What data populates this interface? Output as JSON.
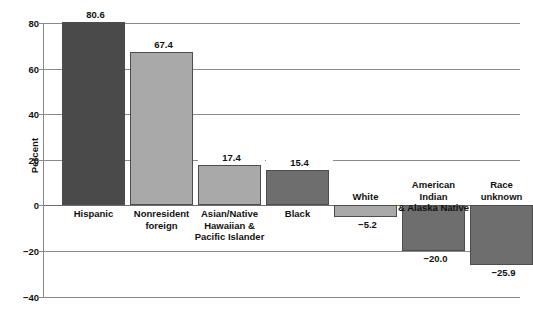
{
  "chart_data": {
    "type": "bar",
    "title": "",
    "xlabel": "",
    "ylabel": "Percent",
    "ylim": [
      -40,
      80
    ],
    "ytick_step": 20,
    "yticks": [
      "80",
      "60",
      "40",
      "20",
      "0",
      "-20",
      "-40"
    ],
    "grid": true,
    "legend": "none",
    "categories": [
      "Hispanic",
      "Nonresident foreign",
      "Asian/Native Hawaiian & Pacific Islander",
      "Black",
      "White",
      "American Indian & Alaska Native",
      "Race unknown"
    ],
    "category_lines": [
      [
        "Hispanic"
      ],
      [
        "Nonresident",
        "foreign"
      ],
      [
        "Asian/Native",
        "Hawaiian &",
        "Pacific Islander"
      ],
      [
        "Black"
      ],
      [
        "White"
      ],
      [
        "American Indian",
        "& Alaska Native"
      ],
      [
        "Race",
        "unknown"
      ]
    ],
    "values": [
      80.6,
      67.4,
      17.4,
      15.4,
      -5.2,
      -20.0,
      -25.9
    ],
    "value_labels": [
      "80.6",
      "67.4",
      "17.4",
      "15.4",
      "−5.2",
      "−20.0",
      "−25.9"
    ],
    "bar_colors": [
      "#4a4a4a",
      "#a9a9a9",
      "#a9a9a9",
      "#6e6e6e",
      "#a9a9a9",
      "#6e6e6e",
      "#6e6e6e"
    ]
  },
  "colors": {
    "dark_gray": "#4a4a4a",
    "medium_gray": "#6e6e6e",
    "light_gray": "#a9a9a9",
    "gridline": "#8a8a8a",
    "background": "#ffffff"
  }
}
